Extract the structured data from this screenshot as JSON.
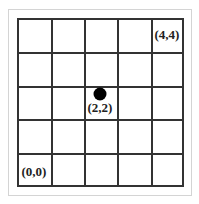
{
  "diagram": {
    "grid": {
      "rows": 5,
      "cols": 5
    },
    "labels": {
      "top_right": "(4,4)",
      "center": "(2,2)",
      "bottom_left": "(0,0)"
    },
    "point": {
      "x": 2,
      "y": 2,
      "color": "#000000"
    },
    "colors": {
      "grid_line": "#333333",
      "frame": "#d4d4d4",
      "background": "#ffffff"
    }
  }
}
